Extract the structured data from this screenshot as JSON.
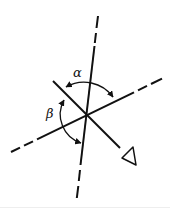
{
  "diagram": {
    "title": "",
    "labels": {
      "alpha": "α",
      "beta": "β"
    },
    "colors": {
      "stroke": "#111111",
      "background": "#ffffff"
    },
    "elements": [
      {
        "id": "vertical-axis",
        "type": "line",
        "style": "solid-with-dashed-ends"
      },
      {
        "id": "horizontal-axis",
        "type": "line",
        "style": "solid-with-dashed-ends"
      },
      {
        "id": "viewing-direction-line",
        "type": "line",
        "style": "solid",
        "terminator": "triangle"
      },
      {
        "id": "alpha-arc",
        "type": "arc",
        "arrows": "both",
        "label": "α"
      },
      {
        "id": "beta-arc",
        "type": "arc",
        "arrows": "both",
        "label": "β"
      }
    ]
  }
}
